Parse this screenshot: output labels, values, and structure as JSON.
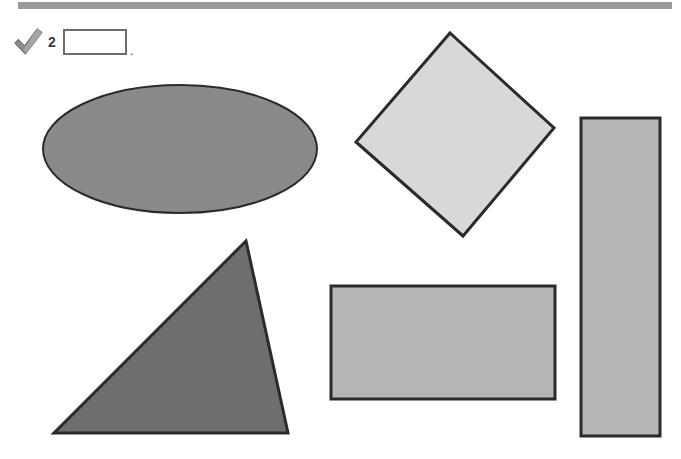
{
  "page": {
    "width": 681,
    "height": 459,
    "background": "#ffffff",
    "top_bar_color": "#9a9a9a"
  },
  "question": {
    "check_icon": "check-mark-icon",
    "check_icon_color": "#8c8c8c",
    "number": "2",
    "answer_value": "",
    "answer_placeholder": "",
    "trailing_punctuation": "."
  },
  "shapes": [
    {
      "id": "ellipse",
      "name": "ellipse-shape",
      "type": "ellipse",
      "fill": "#8a8a8a",
      "stroke": "#2b2b2b",
      "stroke_width": 2,
      "cx": 180,
      "cy": 149,
      "rx": 137,
      "ry": 64
    },
    {
      "id": "diamond",
      "name": "diamond-shape",
      "type": "polygon",
      "fill": "#d8d8d8",
      "stroke": "#2b2b2b",
      "stroke_width": 3,
      "points": "450,33 554,128 463,236 356,142"
    },
    {
      "id": "vertical-rectangle",
      "name": "vertical-rectangle-shape",
      "type": "rect",
      "fill": "#b5b5b5",
      "stroke": "#2b2b2b",
      "stroke_width": 3,
      "x": 581,
      "y": 118,
      "width": 79,
      "height": 318
    },
    {
      "id": "triangle",
      "name": "triangle-shape",
      "type": "polygon",
      "fill": "#6e6e6e",
      "stroke": "#2b2b2b",
      "stroke_width": 3,
      "points": "246,241 288,433 54,433"
    },
    {
      "id": "horizontal-rectangle",
      "name": "horizontal-rectangle-shape",
      "type": "rect",
      "fill": "#b5b5b5",
      "stroke": "#2b2b2b",
      "stroke_width": 3,
      "x": 331,
      "y": 286,
      "width": 224,
      "height": 113
    }
  ]
}
